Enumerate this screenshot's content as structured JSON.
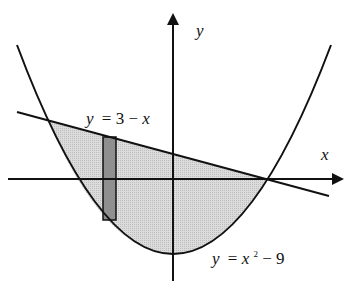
{
  "diagram": {
    "type": "region-between-curves",
    "axes": {
      "x_label": "x",
      "y_label": "y"
    },
    "curves": [
      {
        "id": "line",
        "label_var": "y",
        "label_eq": "= 3 − ",
        "label_tail": "x",
        "equation": "y = 3 - x"
      },
      {
        "id": "parabola",
        "label_var": "y",
        "label_eq": "= ",
        "label_x": "x",
        "label_exp": "2",
        "label_tail": " − 9",
        "equation": "y = x^2 - 9"
      }
    ],
    "intersections": [
      {
        "x": -4,
        "y": 7
      },
      {
        "x": 3,
        "y": 0
      }
    ],
    "shaded_region": "between y = 3 - x (top) and y = x^2 - 9 (bottom) for -4 <= x <= 3",
    "strip": "vertical representative rectangle near x = -2",
    "colors": {
      "region_fill": "#d4d4d4",
      "strip_fill": "#8c8c8c",
      "stroke": "#111111"
    }
  }
}
